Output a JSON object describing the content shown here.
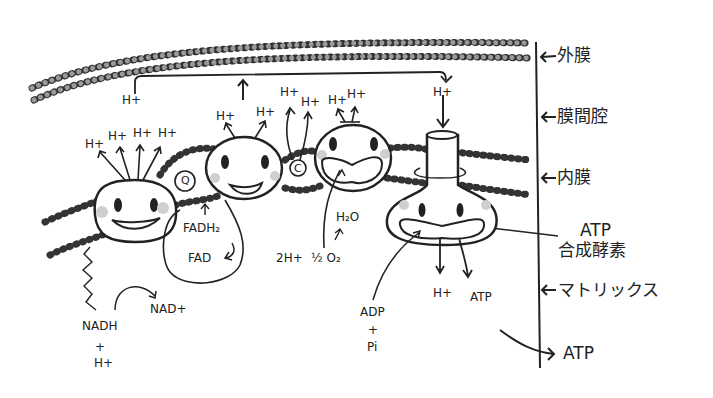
{
  "side_labels": {
    "outer_membrane": "外膜",
    "intermembrane_space": "膜間腔",
    "inner_membrane": "内膜",
    "atp_synthase_1": "ATP",
    "atp_synthase_2": "合成酵素",
    "matrix": "マトリックス",
    "atp_out": "ATP"
  },
  "labels": {
    "h_top_left": "H+",
    "h_top_right": "H+",
    "h": "H+",
    "q": "Q",
    "c": "C",
    "fadh2": "FADH₂",
    "fad": "FAD",
    "h2o": "H₂O",
    "two_h": "2H+",
    "half_o2": "½ O₂",
    "nadh": "NADH",
    "plus": "+",
    "nad": "NAD+",
    "adp": "ADP",
    "pi": "Pi",
    "h_matrix": "H+",
    "atp_matrix": "ATP"
  },
  "colors": {
    "ink": "#222222",
    "bead": "#9a9a9a",
    "cheek": "#cfcfcf"
  }
}
